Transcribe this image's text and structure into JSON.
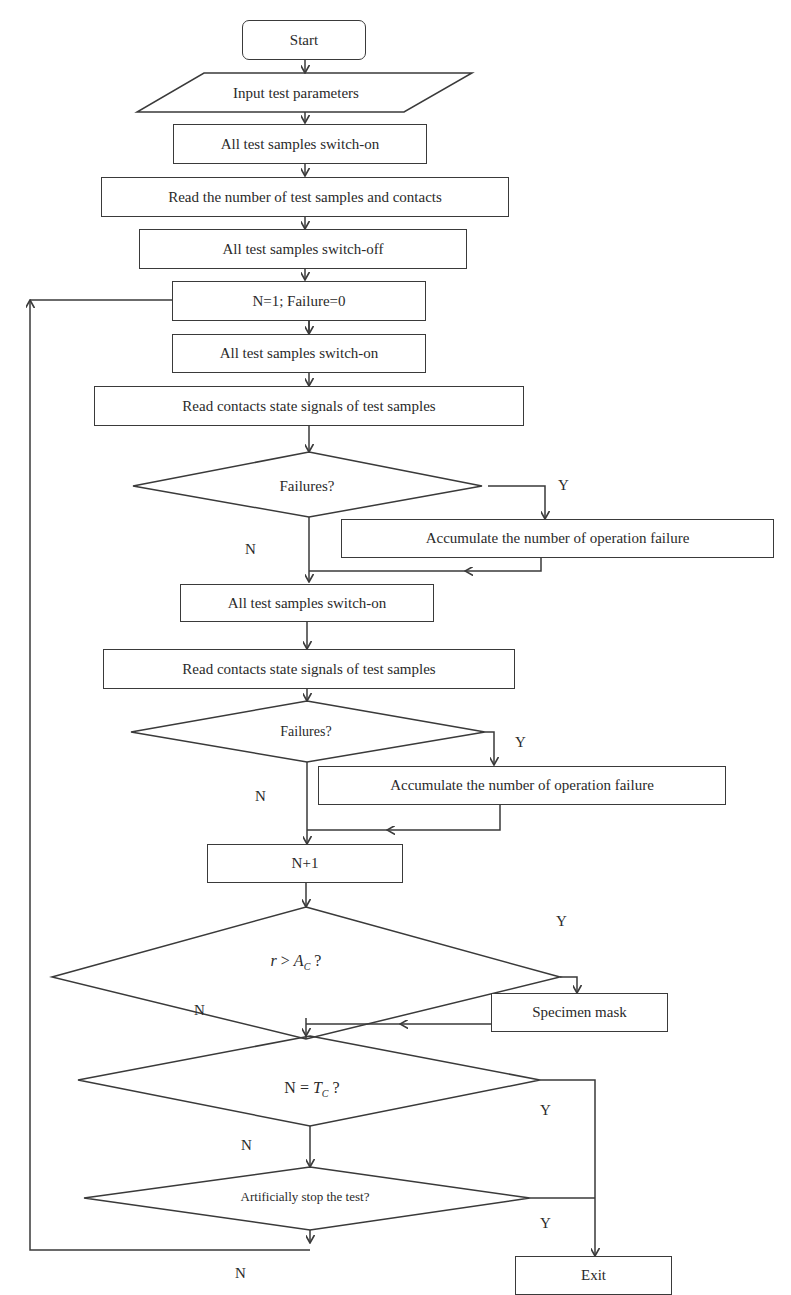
{
  "diagram": {
    "type": "flowchart",
    "nodes": {
      "start": "Start",
      "input": "Input test parameters",
      "switch_on_1": "All test samples switch-on",
      "read_number": "Read the number of test samples and contacts",
      "switch_off": "All test samples switch-off",
      "init": "N=1; Failure=0",
      "switch_on_2": "All test samples switch-on",
      "read_state_1": "Read contacts state signals of test samples",
      "decision_failures_1": "Failures?",
      "accumulate_1": "Accumulate the number of operation failure",
      "switch_on_3": "All test samples switch-on",
      "read_state_2": "Read contacts state signals of test samples",
      "decision_failures_2": "Failures?",
      "accumulate_2": "Accumulate the number of operation failure",
      "increment": "N+1",
      "decision_r_var": "r",
      "decision_r_op": " > ",
      "decision_r_rhs": "A",
      "decision_r_sub": "C",
      "decision_r_q": " ?",
      "mask": "Specimen mask",
      "decision_n_lhs": "N = ",
      "decision_n_rhs": "T",
      "decision_n_sub": "C",
      "decision_n_q": " ?",
      "decision_stop": "Artificially stop the test?",
      "exit": "Exit"
    },
    "branch_labels": {
      "yes": "Y",
      "no": "N"
    },
    "colors": {
      "line": "#3a3a3a",
      "background": "#ffffff"
    }
  }
}
